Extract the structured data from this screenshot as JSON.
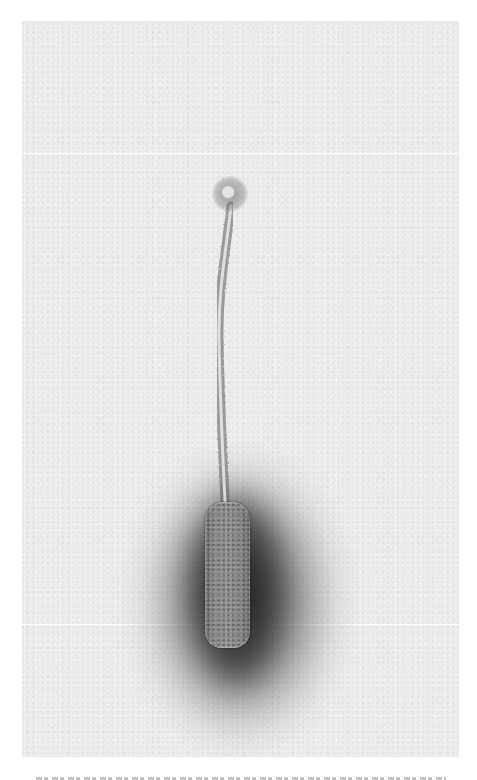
{
  "figure": {
    "type": "transmission electron micrograph (negative stain)",
    "colors": {
      "background": "#ececec",
      "page": "#ffffff",
      "body": "#878787",
      "halo": "#2a2a2a"
    },
    "regions": {
      "head": {
        "cx": 231,
        "cy": 195
      },
      "tail": {
        "from_y": 210,
        "to_y": 500
      },
      "body": {
        "x": 205,
        "y": 502,
        "width": 45,
        "height": 146
      },
      "scan_lines_y": [
        153,
        624
      ]
    }
  },
  "caption": {
    "text": "",
    "visible": "truncated — only glyph tops visible, text illegible"
  }
}
